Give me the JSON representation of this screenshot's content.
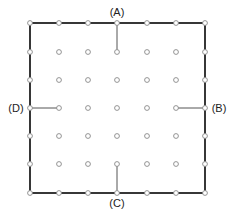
{
  "diagram": {
    "type": "pegboard-grid",
    "grid": {
      "columns": 7,
      "rows": 7,
      "x_positions": [
        30,
        59,
        88,
        117,
        147,
        176,
        205
      ],
      "y_positions": [
        23,
        52,
        80,
        108,
        136,
        164,
        193
      ],
      "dot_radius": 2.4,
      "dot_stroke": "#888888",
      "dot_fill": "#ffffff"
    },
    "border": {
      "x1": 30,
      "y1": 23,
      "x2": 205,
      "y2": 193,
      "stroke": "#222222",
      "stroke_width": 1.8
    },
    "segments": [
      {
        "id": "A",
        "x1": 117,
        "y1": 23,
        "x2": 117,
        "y2": 52
      },
      {
        "id": "B",
        "x1": 176,
        "y1": 108,
        "x2": 205,
        "y2": 108
      },
      {
        "id": "C",
        "x1": 117,
        "y1": 164,
        "x2": 117,
        "y2": 193
      },
      {
        "id": "D",
        "x1": 30,
        "y1": 108,
        "x2": 59,
        "y2": 108
      }
    ],
    "segment_stroke": "#555555",
    "labels": [
      {
        "id": "A",
        "text": "(A)",
        "x": 117,
        "y": 12
      },
      {
        "id": "B",
        "text": "(B)",
        "x": 219,
        "y": 108
      },
      {
        "id": "C",
        "text": "(C)",
        "x": 117,
        "y": 203
      },
      {
        "id": "D",
        "text": "(D)",
        "x": 16,
        "y": 108
      }
    ]
  }
}
